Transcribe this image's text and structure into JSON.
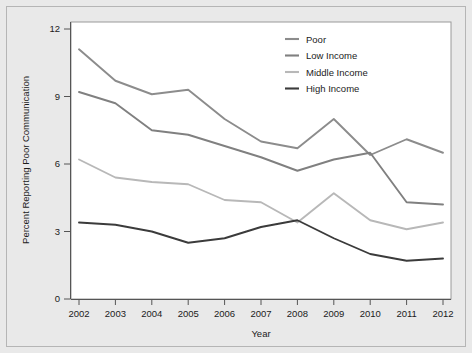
{
  "chart_data": {
    "type": "line",
    "title": "",
    "xlabel": "Year",
    "ylabel": "Percent Reporting Poor Communication",
    "categories": [
      "2002",
      "2003",
      "2004",
      "2005",
      "2006",
      "2007",
      "2008",
      "2009",
      "2010",
      "2011",
      "2012"
    ],
    "x": [
      2002,
      2003,
      2004,
      2005,
      2006,
      2007,
      2008,
      2009,
      2010,
      2011,
      2012
    ],
    "xlim": [
      2002,
      2012
    ],
    "ylim": [
      0,
      12
    ],
    "yticks": [
      0,
      3,
      6,
      9,
      12
    ],
    "ytick_labels": [
      "0",
      "3",
      "6",
      "9",
      "12"
    ],
    "xtick_labels": [
      "2002",
      "2003",
      "2004",
      "2005",
      "2006",
      "2007",
      "2008",
      "2009",
      "2010",
      "2011",
      "2012"
    ],
    "grid": false,
    "legend_position": "top-right",
    "series": [
      {
        "name": "Poor",
        "color": "#8c8c8c",
        "values": [
          11.1,
          9.7,
          9.1,
          9.3,
          8.0,
          7.0,
          6.7,
          8.0,
          6.4,
          7.1,
          6.5
        ]
      },
      {
        "name": "Low Income",
        "color": "#808080",
        "values": [
          9.2,
          8.7,
          7.5,
          7.3,
          6.8,
          6.3,
          5.7,
          6.2,
          6.5,
          4.3,
          4.2
        ]
      },
      {
        "name": "Middle Income",
        "color": "#b8b8b8",
        "values": [
          6.2,
          5.4,
          5.2,
          5.1,
          4.4,
          4.3,
          3.4,
          4.7,
          3.5,
          3.1,
          3.4
        ]
      },
      {
        "name": "High Income",
        "color": "#3b3b3b",
        "values": [
          3.4,
          3.3,
          3.0,
          2.5,
          2.7,
          3.2,
          3.5,
          2.7,
          2.0,
          1.7,
          1.8
        ]
      }
    ]
  },
  "legend": {
    "entries": [
      {
        "label": "Poor"
      },
      {
        "label": "Low Income"
      },
      {
        "label": "Middle Income"
      },
      {
        "label": "High Income"
      }
    ]
  },
  "axes": {
    "x_title": "Year",
    "y_title": "Percent Reporting Poor Communication"
  }
}
